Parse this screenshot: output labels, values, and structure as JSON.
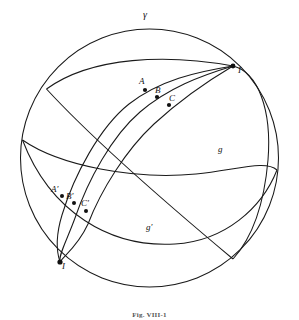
{
  "figure": {
    "kind": "geometric-diagram",
    "caption": "Fig. VIII-1",
    "stroke_color": "#1a1a1a",
    "background_color": "#ffffff"
  },
  "labels": {
    "gamma": "γ",
    "pole_top": "I",
    "pole_bottom": "I",
    "a": "A",
    "b": "B",
    "c": "C",
    "a_prime": "A′",
    "b_prime": "B′",
    "c_prime": "C′",
    "g": "g",
    "g_prime": "g′"
  },
  "geometry": {
    "sphere": {
      "center_x": 149.5,
      "center_y": 158,
      "radius": 129
    },
    "points": [
      {
        "name": "A",
        "x": 145,
        "y": 90
      },
      {
        "name": "B",
        "x": 157,
        "y": 97
      },
      {
        "name": "C",
        "x": 169,
        "y": 104
      },
      {
        "name": "A'",
        "x": 62,
        "y": 196
      },
      {
        "name": "B'",
        "x": 74,
        "y": 203
      },
      {
        "name": "C'",
        "x": 86,
        "y": 210
      },
      {
        "name": "I",
        "x": 233,
        "y": 66
      },
      {
        "name": "I'",
        "x": 60,
        "y": 262
      }
    ],
    "curves": [
      {
        "name": "outline-gamma",
        "type": "circle"
      },
      {
        "name": "great-circle-g",
        "type": "arc"
      },
      {
        "name": "great-circle-g-prime",
        "type": "arc"
      },
      {
        "name": "geodesic-a",
        "type": "arc"
      },
      {
        "name": "geodesic-b",
        "type": "arc"
      },
      {
        "name": "geodesic-c",
        "type": "arc"
      }
    ]
  }
}
